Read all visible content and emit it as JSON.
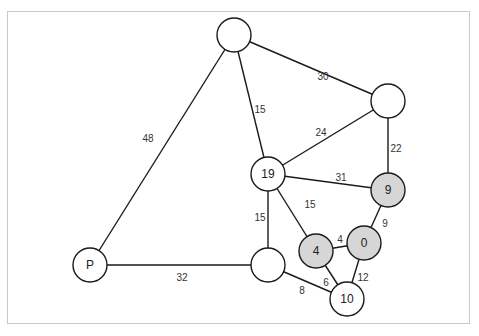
{
  "diagram": {
    "type": "weighted-graph",
    "highlight_color": "#d6d6d6",
    "nodes": [
      {
        "id": "top",
        "label": "",
        "highlighted": false
      },
      {
        "id": "right",
        "label": "",
        "highlighted": false
      },
      {
        "id": "n19",
        "label": "19",
        "highlighted": false
      },
      {
        "id": "n9",
        "label": "9",
        "highlighted": true
      },
      {
        "id": "n4",
        "label": "4",
        "highlighted": true
      },
      {
        "id": "n0",
        "label": "0",
        "highlighted": true
      },
      {
        "id": "mid",
        "label": "",
        "highlighted": false
      },
      {
        "id": "n10",
        "label": "10",
        "highlighted": false
      },
      {
        "id": "P",
        "label": "P",
        "highlighted": false
      }
    ],
    "edges": [
      {
        "from": "P",
        "to": "top",
        "weight": "48"
      },
      {
        "from": "top",
        "to": "right",
        "weight": "30"
      },
      {
        "from": "top",
        "to": "n19",
        "weight": "15"
      },
      {
        "from": "n19",
        "to": "right",
        "weight": "24"
      },
      {
        "from": "right",
        "to": "n9",
        "weight": "22"
      },
      {
        "from": "n19",
        "to": "n9",
        "weight": "31"
      },
      {
        "from": "n19",
        "to": "n4",
        "weight": "15"
      },
      {
        "from": "n19",
        "to": "mid",
        "weight": "15"
      },
      {
        "from": "n9",
        "to": "n0",
        "weight": "9"
      },
      {
        "from": "n4",
        "to": "n0",
        "weight": "4"
      },
      {
        "from": "n0",
        "to": "n10",
        "weight": "12"
      },
      {
        "from": "n4",
        "to": "n10",
        "weight": "6"
      },
      {
        "from": "mid",
        "to": "n10",
        "weight": "8"
      },
      {
        "from": "P",
        "to": "mid",
        "weight": "32"
      }
    ]
  }
}
